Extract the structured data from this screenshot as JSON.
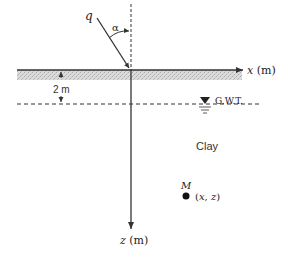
{
  "diagram": {
    "load": {
      "symbol": "q",
      "angle_symbol": "α"
    },
    "axes": {
      "x_label": "x (m)",
      "z_label": "z (m)"
    },
    "water_table": {
      "depth_label": "2 m",
      "label": "G.W.T."
    },
    "soil": {
      "label": "Clay"
    },
    "point": {
      "name": "M",
      "coords": "(x, z)"
    }
  },
  "colors": {
    "line": "#333333",
    "hatch": "#c8c8c8",
    "background": "#ffffff"
  }
}
